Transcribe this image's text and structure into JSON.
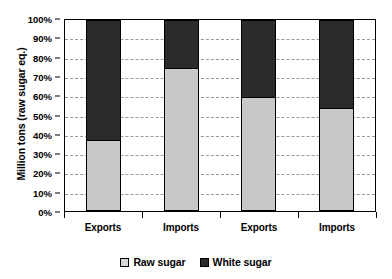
{
  "chart_data": {
    "type": "bar",
    "subtype": "stacked-100-percent",
    "title": "",
    "xlabel": "",
    "ylabel": "Million tons (raw sugar eq.)",
    "categories": [
      "Exports",
      "Imports",
      "Exports",
      "Imports"
    ],
    "series": [
      {
        "name": "Raw sugar",
        "values": [
          37,
          75,
          60,
          54
        ],
        "color": "#c8c8c8"
      },
      {
        "name": "White sugar",
        "values": [
          63,
          25,
          40,
          46
        ],
        "color": "#2b2b2b"
      }
    ],
    "ylim": [
      0,
      100
    ],
    "ytick_labels": [
      "100%",
      "90%",
      "80%",
      "70%",
      "60%",
      "50%",
      "40%",
      "30%",
      "20%",
      "10%",
      "0%"
    ],
    "ytick_values": [
      100,
      90,
      80,
      70,
      60,
      50,
      40,
      30,
      20,
      10,
      0
    ],
    "grid": true,
    "grid_style": "dashed-horizontal",
    "legend_position": "bottom-center",
    "legend_entries": [
      "Raw sugar",
      "White sugar"
    ]
  },
  "axis": {
    "y_title": "Million tons (raw sugar eq.)"
  },
  "legend": {
    "items": [
      {
        "label": "Raw sugar",
        "swatch": "light-gray-square-icon"
      },
      {
        "label": "White sugar",
        "swatch": "dark-square-icon"
      }
    ]
  }
}
